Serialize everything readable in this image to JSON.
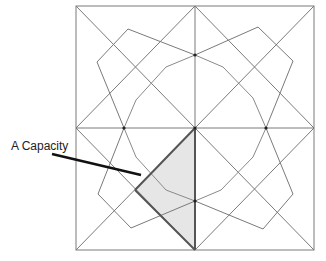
{
  "diagram": {
    "label": "A Capacity",
    "colors": {
      "line": "#7a7a7a",
      "thick_line": "#555555",
      "pointer": "#111111",
      "shade": "#e6e6e6",
      "node": "#222222"
    },
    "square": {
      "x1": 76,
      "y1": 6,
      "x2": 314,
      "y2": 250
    },
    "center": [
      195,
      128
    ],
    "nodes": [
      [
        195,
        55
      ],
      [
        124,
        128
      ],
      [
        195,
        128
      ],
      [
        266,
        128
      ],
      [
        195,
        201
      ]
    ],
    "outer_star": [
      [
        97,
        62
      ],
      [
        128,
        29
      ],
      [
        195,
        55
      ],
      [
        258,
        27
      ],
      [
        293,
        61
      ],
      [
        266,
        128
      ],
      [
        293,
        194
      ],
      [
        263,
        229
      ],
      [
        195,
        201
      ],
      [
        131,
        228
      ],
      [
        98,
        194
      ],
      [
        124,
        128
      ]
    ],
    "inner_octagon": [
      [
        136,
        100
      ],
      [
        166,
        67
      ],
      [
        195,
        55
      ],
      [
        223,
        67
      ],
      [
        253,
        98
      ],
      [
        266,
        128
      ],
      [
        253,
        157
      ],
      [
        221,
        190
      ],
      [
        195,
        201
      ],
      [
        166,
        190
      ],
      [
        136,
        157
      ],
      [
        124,
        128
      ]
    ],
    "shaded_triangle": [
      [
        195,
        128
      ],
      [
        195,
        250
      ],
      [
        135,
        190
      ]
    ],
    "pointer_line": [
      [
        52,
        154
      ],
      [
        141,
        175
      ]
    ],
    "label_position": [
      11,
      139
    ]
  }
}
